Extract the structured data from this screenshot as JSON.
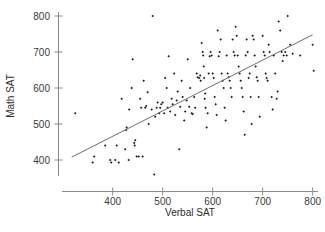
{
  "chart_data": {
    "type": "scatter",
    "title": "",
    "xlabel": "Verbal SAT",
    "ylabel": "Math SAT",
    "xlim": [
      310,
      810
    ],
    "ylim": [
      345,
      815
    ],
    "grid": false,
    "legend": "none",
    "xticks": [
      400,
      500,
      600,
      700,
      800
    ],
    "xticklabels": [
      "400",
      "500",
      "600",
      "700",
      "800"
    ],
    "yticks": [
      400,
      500,
      600,
      700,
      800
    ],
    "yticklabels": [
      "400",
      "500",
      "600",
      "700",
      "800"
    ],
    "annotations": [
      {
        "name": "regression-line",
        "type": "line",
        "x": [
          318,
          800
        ],
        "y": [
          408,
          748
        ]
      }
    ],
    "series": [
      {
        "name": "students",
        "marker": "diamond",
        "color": "#1c1c1c",
        "points": [
          [
            325,
            530
          ],
          [
            360,
            393
          ],
          [
            363,
            410
          ],
          [
            385,
            440
          ],
          [
            395,
            400
          ],
          [
            397,
            393
          ],
          [
            405,
            400
          ],
          [
            408,
            440
          ],
          [
            412,
            393
          ],
          [
            418,
            570
          ],
          [
            425,
            430
          ],
          [
            427,
            483
          ],
          [
            428,
            490
          ],
          [
            432,
            400
          ],
          [
            433,
            540
          ],
          [
            438,
            600
          ],
          [
            440,
            680
          ],
          [
            443,
            447
          ],
          [
            444,
            440
          ],
          [
            445,
            455
          ],
          [
            448,
            410
          ],
          [
            452,
            410
          ],
          [
            455,
            570
          ],
          [
            457,
            545
          ],
          [
            460,
            410
          ],
          [
            462,
            620
          ],
          [
            465,
            545
          ],
          [
            467,
            550
          ],
          [
            470,
            588
          ],
          [
            472,
            500
          ],
          [
            478,
            540
          ],
          [
            480,
            800
          ],
          [
            483,
            360
          ],
          [
            485,
            520
          ],
          [
            488,
            545
          ],
          [
            490,
            560
          ],
          [
            493,
            530
          ],
          [
            495,
            545
          ],
          [
            497,
            555
          ],
          [
            500,
            560
          ],
          [
            503,
            530
          ],
          [
            505,
            628
          ],
          [
            508,
            600
          ],
          [
            510,
            545
          ],
          [
            512,
            688
          ],
          [
            515,
            535
          ],
          [
            518,
            570
          ],
          [
            520,
            555
          ],
          [
            523,
            640
          ],
          [
            525,
            525
          ],
          [
            528,
            565
          ],
          [
            530,
            590
          ],
          [
            533,
            430
          ],
          [
            535,
            548
          ],
          [
            538,
            620
          ],
          [
            540,
            575
          ],
          [
            543,
            510
          ],
          [
            545,
            535
          ],
          [
            548,
            565
          ],
          [
            550,
            680
          ],
          [
            553,
            548
          ],
          [
            555,
            600
          ],
          [
            558,
            530
          ],
          [
            560,
            528
          ],
          [
            563,
            575
          ],
          [
            565,
            545
          ],
          [
            568,
            640
          ],
          [
            570,
            630
          ],
          [
            573,
            628
          ],
          [
            575,
            635
          ],
          [
            576,
            620
          ],
          [
            578,
            725
          ],
          [
            580,
            700
          ],
          [
            581,
            690
          ],
          [
            582,
            660
          ],
          [
            583,
            628
          ],
          [
            584,
            570
          ],
          [
            585,
            585
          ],
          [
            586,
            545
          ],
          [
            588,
            490
          ],
          [
            590,
            530
          ],
          [
            592,
            640
          ],
          [
            594,
            688
          ],
          [
            596,
            700
          ],
          [
            598,
            690
          ],
          [
            600,
            640
          ],
          [
            602,
            628
          ],
          [
            604,
            575
          ],
          [
            606,
            555
          ],
          [
            608,
            525
          ],
          [
            610,
            760
          ],
          [
            612,
            688
          ],
          [
            614,
            700
          ],
          [
            616,
            735
          ],
          [
            618,
            640
          ],
          [
            620,
            620
          ],
          [
            622,
            600
          ],
          [
            624,
            545
          ],
          [
            626,
            510
          ],
          [
            628,
            690
          ],
          [
            630,
            640
          ],
          [
            632,
            630
          ],
          [
            634,
            620
          ],
          [
            636,
            600
          ],
          [
            638,
            575
          ],
          [
            640,
            735
          ],
          [
            642,
            700
          ],
          [
            644,
            690
          ],
          [
            646,
            770
          ],
          [
            648,
            745
          ],
          [
            650,
            690
          ],
          [
            652,
            660
          ],
          [
            654,
            640
          ],
          [
            656,
            620
          ],
          [
            658,
            600
          ],
          [
            660,
            575
          ],
          [
            662,
            535
          ],
          [
            664,
            470
          ],
          [
            666,
            690
          ],
          [
            668,
            735
          ],
          [
            670,
            700
          ],
          [
            672,
            628
          ],
          [
            674,
            640
          ],
          [
            676,
            575
          ],
          [
            678,
            500
          ],
          [
            680,
            745
          ],
          [
            682,
            735
          ],
          [
            684,
            690
          ],
          [
            686,
            660
          ],
          [
            688,
            630
          ],
          [
            690,
            620
          ],
          [
            692,
            575
          ],
          [
            694,
            520
          ],
          [
            700,
            745
          ],
          [
            702,
            700
          ],
          [
            704,
            690
          ],
          [
            706,
            640
          ],
          [
            708,
            628
          ],
          [
            710,
            620
          ],
          [
            712,
            720
          ],
          [
            714,
            700
          ],
          [
            718,
            575
          ],
          [
            720,
            540
          ],
          [
            722,
            690
          ],
          [
            725,
            640
          ],
          [
            728,
            570
          ],
          [
            730,
            590
          ],
          [
            732,
            785
          ],
          [
            735,
            760
          ],
          [
            738,
            700
          ],
          [
            740,
            675
          ],
          [
            742,
            690
          ],
          [
            745,
            700
          ],
          [
            748,
            690
          ],
          [
            750,
            800
          ],
          [
            755,
            720
          ],
          [
            760,
            695
          ],
          [
            775,
            690
          ],
          [
            800,
            720
          ],
          [
            802,
            648
          ]
        ]
      }
    ]
  },
  "axes": {
    "y_title": "Math SAT",
    "x_title": "Verbal SAT"
  }
}
